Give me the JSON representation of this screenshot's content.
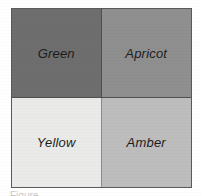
{
  "figure": {
    "type": "2x2-color-grid",
    "cells": [
      {
        "id": "top-left",
        "label": "Green",
        "fill": "#6e6e6e"
      },
      {
        "id": "top-right",
        "label": "Apricot",
        "fill": "#8f8f8f"
      },
      {
        "id": "bottom-left",
        "label": "Yellow",
        "fill": "#eaeae8"
      },
      {
        "id": "bottom-right",
        "label": "Amber",
        "fill": "#bdbdbd"
      }
    ],
    "border_color": "#5a5a5a",
    "background": "#ffffff",
    "text_color": "#1c1c1c"
  },
  "caption": {
    "text": "Figure"
  }
}
